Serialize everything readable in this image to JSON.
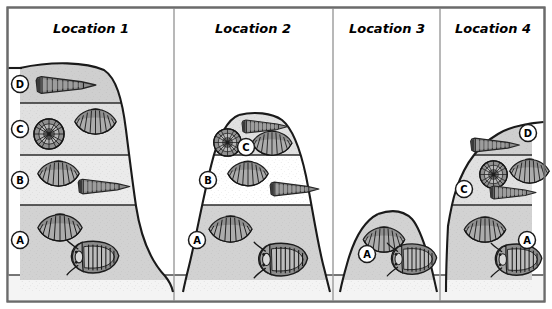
{
  "figure": {
    "kind": "stratigraphic-correlation-diagram",
    "frame": {
      "border_color": "#6b6b6b",
      "background": "#ffffff"
    },
    "baseline_band": {
      "label": "basement-band",
      "fill": "#f4f4f4"
    }
  },
  "palette": {
    "layer_A": "#d2d2d2",
    "layer_B": "#ebebeb",
    "layer_C": "#e0e0e0",
    "layer_D": "#cfcfcf",
    "outline": "#1a1a1a",
    "divider": "#9a9a9a",
    "fossil_ink": "#3a3a3a"
  },
  "columns": [
    {
      "id": "loc1",
      "title": "Location 1"
    },
    {
      "id": "loc2",
      "title": "Location 2"
    },
    {
      "id": "loc3",
      "title": "Location 3"
    },
    {
      "id": "loc4",
      "title": "Location 4"
    }
  ],
  "layer_keys": [
    "A",
    "B",
    "C",
    "D"
  ],
  "locations": [
    {
      "id": "loc1",
      "title": "Location 1",
      "layers": [
        {
          "key": "D",
          "label": "D",
          "fossils": [
            "cone-shell"
          ]
        },
        {
          "key": "C",
          "label": "C",
          "fossils": [
            "ammonite",
            "brachiopod"
          ]
        },
        {
          "key": "B",
          "label": "B",
          "fossils": [
            "brachiopod",
            "cone-shell"
          ]
        },
        {
          "key": "A",
          "label": "A",
          "fossils": [
            "brachiopod",
            "trilobite"
          ]
        }
      ]
    },
    {
      "id": "loc2",
      "title": "Location 2",
      "layers": [
        {
          "key": "C",
          "label": "C",
          "fossils": [
            "cone-shell",
            "ammonite",
            "brachiopod"
          ]
        },
        {
          "key": "B",
          "label": "B",
          "fossils": [
            "brachiopod",
            "cone-shell"
          ]
        },
        {
          "key": "A",
          "label": "A",
          "fossils": [
            "brachiopod",
            "trilobite"
          ]
        }
      ]
    },
    {
      "id": "loc3",
      "title": "Location 3",
      "layers": [
        {
          "key": "A",
          "label": "A",
          "fossils": [
            "brachiopod",
            "trilobite"
          ]
        }
      ]
    },
    {
      "id": "loc4",
      "title": "Location 4",
      "layers": [
        {
          "key": "D",
          "label": "D",
          "fossils": [
            "cone-shell"
          ]
        },
        {
          "key": "C",
          "label": "C",
          "fossils": [
            "ammonite",
            "brachiopod",
            "cone-shell"
          ]
        },
        {
          "key": "A",
          "label": "A",
          "fossils": [
            "brachiopod",
            "trilobite"
          ]
        }
      ]
    }
  ],
  "labels": {
    "loc1_title": "Location 1",
    "loc2_title": "Location 2",
    "loc3_title": "Location 3",
    "loc4_title": "Location 4",
    "A": "A",
    "B": "B",
    "C": "C",
    "D": "D"
  }
}
